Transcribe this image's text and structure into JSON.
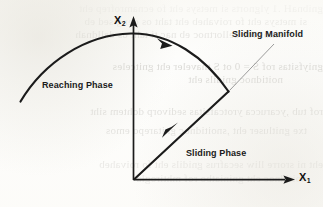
{
  "figure": {
    "type": "phase-portrait",
    "axes": {
      "x_label": "X",
      "x_subscript": "1",
      "y_label": "X",
      "y_subscript": "2",
      "origin_px": [
        133,
        180
      ],
      "x_axis_end_px": [
        292,
        180
      ],
      "y_axis_end_px": [
        133,
        18
      ],
      "stroke_color": "#1b1b1b"
    },
    "labels": {
      "reaching_phase": "Reaching Phase",
      "sliding_manifold": "Sliding Manifold",
      "sliding_phase": "Sliding Phase"
    },
    "curves": [
      {
        "name": "reaching-phase-trajectory",
        "style": "bold-arc",
        "stroke_color": "#1b1b1b",
        "stroke_width": 2.1,
        "start_px": [
          20,
          101
        ],
        "apex_px": [
          131,
          33
        ],
        "end_px": [
          228,
          92
        ],
        "arrow_at_px": [
          167,
          43
        ],
        "arrow_direction": "along-curve-rightward"
      },
      {
        "name": "sliding-phase-line",
        "style": "bold-straight",
        "stroke_color": "#1b1b1b",
        "stroke_width": 2.1,
        "start_px": [
          228,
          92
        ],
        "end_px": [
          134,
          179
        ],
        "arrow_at_px": [
          170,
          131
        ],
        "arrow_direction": "toward-origin"
      },
      {
        "name": "sliding-manifold-leader",
        "style": "thin-line",
        "stroke_color": "#8a8a8a",
        "stroke_width": 0.8,
        "start_px": [
          274,
          44
        ],
        "end_px": [
          229,
          91
        ]
      }
    ],
    "colors": {
      "ink": "#1b1b1b",
      "leader": "#8a8a8a",
      "paper": "#fdfdfb",
      "bleed_text": "#6d6a62"
    }
  },
  "background_bleedthrough": {
    "note": "faint mirrored show-through text from reverse side of scanned page, illegible",
    "lines": [
      "gnibnaH .1 ylgnorts si metsys eht fo ecnamrofrep eht",
      "si metsys eht fo roivaheb eht taht os dengised eb",
      "emos rof dellortnoc eb nac ti taht os delldnah",
      "",
      "gniyfsitas rof S  = 0 ot S tnaveler eht gnitceles",
      "noitidnoc gnidils eht",
      "",
      "rof tub ,ycarucca yrotcafsitas sedivorp dohtem siht",
      "txe gnitluser eht ,snoitidnoc gnitarepo emos",
      "eht ni srorre lliw secafrus gnidils eht fo roivaheb",
      "noitidnoc eht gniniatbo rof mhtirogla",
      "gnidils eht fo ytivitisnes eht yb detceffa eb ton lliw"
    ]
  }
}
